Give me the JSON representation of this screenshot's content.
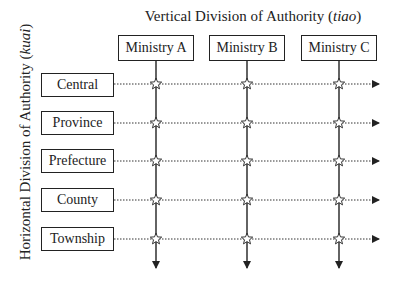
{
  "diagram": {
    "title_prefix": "Vertical Division of Authority (",
    "title_italic": "tiao",
    "title_suffix": ")",
    "side_title_prefix": "Horizontal Division of Authority (",
    "side_title_italic": "kuai",
    "side_title_suffix": ")",
    "ministries": [
      {
        "label": "Ministry A",
        "x": 156
      },
      {
        "label": "Ministry B",
        "x": 247
      },
      {
        "label": "Ministry C",
        "x": 339
      }
    ],
    "levels": [
      {
        "label": "Central",
        "y": 84
      },
      {
        "label": "Province",
        "y": 123
      },
      {
        "label": "Prefecture",
        "y": 161
      },
      {
        "label": "County",
        "y": 200
      },
      {
        "label": "Township",
        "y": 239
      }
    ],
    "intersection_icon": "star-outline",
    "colors": {
      "line": "#222222",
      "background": "#ffffff"
    }
  }
}
